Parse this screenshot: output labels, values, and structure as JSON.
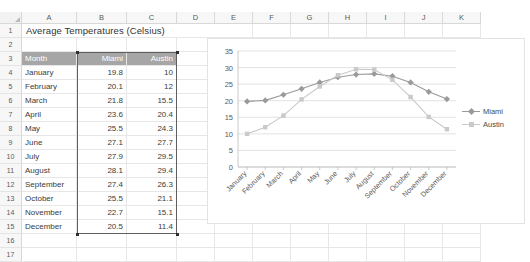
{
  "spreadsheet": {
    "column_headers": [
      "A",
      "B",
      "C",
      "D",
      "E",
      "F",
      "G",
      "H",
      "I",
      "J",
      "K"
    ],
    "row_numbers": [
      "1",
      "2",
      "3",
      "4",
      "5",
      "6",
      "7",
      "8",
      "9",
      "10",
      "11",
      "12",
      "13",
      "14",
      "15",
      "16",
      "17"
    ],
    "title": "Average Temperatures (Celsius)",
    "table_headers": [
      "Month",
      "Miami",
      "Austin"
    ],
    "rows": [
      {
        "month": "January",
        "miami": "19.8",
        "austin": "10"
      },
      {
        "month": "February",
        "miami": "20.1",
        "austin": "12"
      },
      {
        "month": "March",
        "miami": "21.8",
        "austin": "15.5"
      },
      {
        "month": "April",
        "miami": "23.6",
        "austin": "20.4"
      },
      {
        "month": "May",
        "miami": "25.5",
        "austin": "24.3"
      },
      {
        "month": "June",
        "miami": "27.1",
        "austin": "27.7"
      },
      {
        "month": "July",
        "miami": "27.9",
        "austin": "29.5"
      },
      {
        "month": "August",
        "miami": "28.1",
        "austin": "29.4"
      },
      {
        "month": "September",
        "miami": "27.4",
        "austin": "26.3"
      },
      {
        "month": "October",
        "miami": "25.5",
        "austin": "21.1"
      },
      {
        "month": "November",
        "miami": "22.7",
        "austin": "15.1"
      },
      {
        "month": "December",
        "miami": "20.5",
        "austin": "11.4"
      }
    ]
  },
  "chart_data": {
    "type": "line",
    "title": "",
    "xlabel": "",
    "ylabel": "",
    "ylim": [
      0,
      35
    ],
    "yticks": [
      "0",
      "5",
      "10",
      "15",
      "20",
      "25",
      "30",
      "35"
    ],
    "grid": true,
    "legend_position": "right",
    "categories": [
      "January",
      "February",
      "March",
      "April",
      "May",
      "June",
      "July",
      "August",
      "September",
      "October",
      "November",
      "December"
    ],
    "series": [
      {
        "name": "Miami",
        "color": "#9a9a9a",
        "marker": "diamond",
        "values": [
          19.8,
          20.1,
          21.8,
          23.6,
          25.5,
          27.1,
          27.9,
          28.1,
          27.4,
          25.5,
          22.7,
          20.5
        ]
      },
      {
        "name": "Austin",
        "color": "#c9c9c9",
        "marker": "square",
        "values": [
          10,
          12,
          15.5,
          20.4,
          24.3,
          27.7,
          29.5,
          29.4,
          26.3,
          21.1,
          15.1,
          11.4
        ]
      }
    ]
  }
}
